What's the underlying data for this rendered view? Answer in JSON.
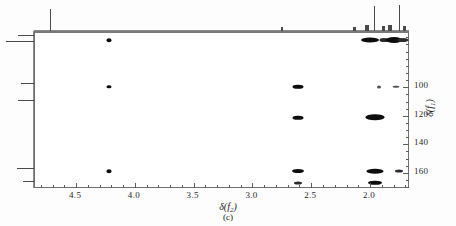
{
  "figure": {
    "panel_label": "(c)",
    "type": "2D NMR HMBC/HSQC correlation spectrum",
    "frame_color": "#6f6f6f",
    "peak_color": "#0d0d0d",
    "background": "#ffffff"
  },
  "axes": {
    "x": {
      "title_delta": "δ",
      "title_paren_open": "(",
      "title_f": "f",
      "title_sub": "2",
      "title_paren_close": ")",
      "full_title": "δ (f2)",
      "major_ticks": [
        4.5,
        4.0,
        3.5,
        3.0,
        2.5,
        2.0
      ],
      "major_labels": [
        "4.5",
        "4.0",
        "3.5",
        "3.0",
        "2.5",
        "2.0"
      ],
      "minor_step": 0.1,
      "range": [
        4.85,
        1.66
      ],
      "direction": "decreasing-left-to-right"
    },
    "y": {
      "title_delta": "δ",
      "title_paren_open": "(",
      "title_f": "f",
      "title_sub": "1",
      "title_paren_close": ")",
      "full_title": "δ (f1)",
      "major_ticks": [
        100,
        120,
        140,
        160
      ],
      "major_labels": [
        "100",
        "120",
        "140",
        "160"
      ],
      "minor_step": 5,
      "range": [
        62,
        172
      ],
      "direction": "increasing-top-to-bottom"
    }
  },
  "chart_data": {
    "type": "scatter",
    "title": "",
    "subtitle": "(c)",
    "xlabel": "δ (f2)",
    "ylabel": "δ (f1)",
    "xlim": [
      4.85,
      1.66
    ],
    "ylim": [
      62,
      172
    ],
    "grid": false,
    "legend": "none",
    "peaks": [
      {
        "x": 4.22,
        "y": 67.0,
        "w": 5,
        "h": 3.5,
        "cls": "pk"
      },
      {
        "x": 4.22,
        "y": 99.5,
        "w": 5,
        "h": 3.5,
        "cls": "pk"
      },
      {
        "x": 4.22,
        "y": 159.0,
        "w": 5,
        "h": 3.5,
        "cls": "pk"
      },
      {
        "x": 2.61,
        "y": 99.5,
        "w": 11,
        "h": 4.5,
        "cls": "pk"
      },
      {
        "x": 2.61,
        "y": 121.5,
        "w": 11,
        "h": 4.5,
        "cls": "pk"
      },
      {
        "x": 2.61,
        "y": 159.0,
        "w": 12,
        "h": 4.0,
        "cls": "pk"
      },
      {
        "x": 2.61,
        "y": 167.0,
        "w": 8,
        "h": 3.0,
        "cls": "pk soft"
      },
      {
        "x": 2.0,
        "y": 67.0,
        "w": 18,
        "h": 5.0,
        "cls": "pk"
      },
      {
        "x": 1.88,
        "y": 67.0,
        "w": 9,
        "h": 4.0,
        "cls": "pk soft"
      },
      {
        "x": 1.8,
        "y": 67.0,
        "w": 17,
        "h": 6.0,
        "cls": "pk"
      },
      {
        "x": 1.72,
        "y": 67.0,
        "w": 11,
        "h": 4.0,
        "cls": "pk soft"
      },
      {
        "x": 1.92,
        "y": 99.5,
        "w": 4,
        "h": 3.0,
        "cls": "pk faint"
      },
      {
        "x": 1.78,
        "y": 99.5,
        "w": 7,
        "h": 2.5,
        "cls": "pk faint"
      },
      {
        "x": 1.96,
        "y": 121.0,
        "w": 19,
        "h": 5.5,
        "cls": "pk"
      },
      {
        "x": 1.96,
        "y": 159.0,
        "w": 17,
        "h": 4.5,
        "cls": "pk"
      },
      {
        "x": 1.75,
        "y": 159.0,
        "w": 8,
        "h": 3.0,
        "cls": "pk soft"
      },
      {
        "x": 1.96,
        "y": 167.0,
        "w": 14,
        "h": 4.5,
        "cls": "pk"
      }
    ],
    "f2_projection": {
      "description": "1D proton trace along top",
      "peaks": [
        {
          "x": 4.71,
          "height": 22,
          "width": 1.2
        },
        {
          "x": 2.74,
          "height": 4,
          "width": 2.5
        },
        {
          "x": 2.12,
          "height": 4,
          "width": 3.0
        },
        {
          "x": 2.02,
          "height": 6,
          "width": 4.0
        },
        {
          "x": 1.95,
          "height": 25,
          "width": 1.2
        },
        {
          "x": 1.88,
          "height": 5,
          "width": 3.0
        },
        {
          "x": 1.82,
          "height": 6,
          "width": 3.5
        },
        {
          "x": 1.74,
          "height": 26,
          "width": 1.2
        },
        {
          "x": 1.7,
          "height": 5,
          "width": 3.0
        }
      ]
    },
    "f1_projection": {
      "description": "1D carbon trace along left",
      "peaks": [
        {
          "y": 65.0,
          "length": 16,
          "thickness": 1.2
        },
        {
          "y": 69.5,
          "length": 28,
          "thickness": 1.2
        },
        {
          "y": 99.0,
          "length": 13,
          "thickness": 1.2
        },
        {
          "y": 110.5,
          "length": 16,
          "thickness": 1.2
        },
        {
          "y": 158.5,
          "length": 17,
          "thickness": 1.2
        },
        {
          "y": 167.5,
          "length": 11,
          "thickness": 1.2
        }
      ]
    }
  }
}
